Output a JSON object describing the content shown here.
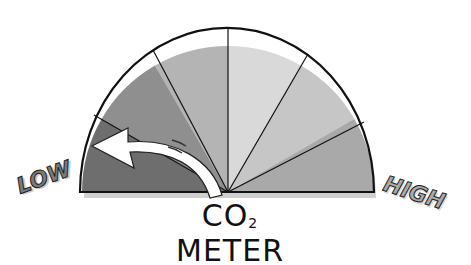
{
  "diagram": {
    "title": "CO2 METER",
    "title_main": "CO",
    "title_sub": "2",
    "title_rest": " METER",
    "low_label": "LOW",
    "high_label": "HIGH",
    "segments": [
      {
        "id": 1,
        "color": "#6e6e6e"
      },
      {
        "id": 2,
        "color": "#8f8f8f"
      },
      {
        "id": 3,
        "color": "#b4b4b4"
      },
      {
        "id": 4,
        "color": "#d9d9d9"
      },
      {
        "id": 5,
        "color": "#c6c6c6"
      },
      {
        "id": 6,
        "color": "#a9a9a9"
      }
    ],
    "needle": {
      "type": "curved-arrow",
      "direction": "toward-low",
      "color": "#ffffff"
    },
    "label_color": "#7a7a7a"
  }
}
